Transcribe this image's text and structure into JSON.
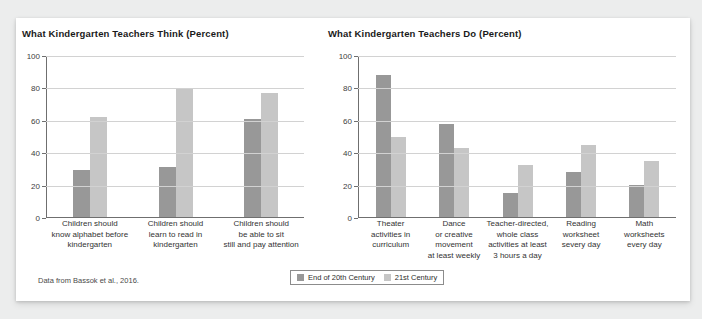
{
  "figure": {
    "source_note": "Data from Bassok et al., 2016.",
    "legend": {
      "items": [
        {
          "label": "End of 20th Century",
          "color": "#989898",
          "icon": "legend-swatch-icon"
        },
        {
          "label": "21st Century",
          "color": "#c6c6c6",
          "icon": "legend-swatch-icon"
        }
      ]
    },
    "colors": {
      "series_a": "#989898",
      "series_b": "#c6c6c6",
      "gridline": "#d2d2d2",
      "axis": "#6f6f6f",
      "card_background": "#ffffff",
      "page_background": "#eceded"
    }
  },
  "chart_data": [
    {
      "type": "bar",
      "title": "What Kindergarten Teachers Think (Percent)",
      "xlabel": "",
      "ylabel": "",
      "ylim": [
        0,
        100
      ],
      "yticks": [
        0,
        20,
        40,
        60,
        80,
        100
      ],
      "grid": true,
      "legend_position": "bottom",
      "categories": [
        "Children should know alphabet before kindergarten",
        "Children should learn to read in kindergarten",
        "Children should be able to sit still and pay attention"
      ],
      "category_lines": [
        [
          "Children should",
          "know alphabet before",
          "kindergarten"
        ],
        [
          "Children should",
          "learn to read in",
          "kindergarten"
        ],
        [
          "Children should",
          "be able to sit",
          "still and pay attention"
        ]
      ],
      "series": [
        {
          "name": "End of 20th Century",
          "values": [
            29,
            31,
            61
          ]
        },
        {
          "name": "21st Century",
          "values": [
            62,
            80,
            77
          ]
        }
      ]
    },
    {
      "type": "bar",
      "title": "What Kindergarten Teachers Do (Percent)",
      "xlabel": "",
      "ylabel": "",
      "ylim": [
        0,
        100
      ],
      "yticks": [
        0,
        20,
        40,
        60,
        80,
        100
      ],
      "grid": true,
      "legend_position": "bottom",
      "categories": [
        "Theater activities in curriculum",
        "Dance or creative movement at least weekly",
        "Teacher-directed, whole class activities at least 3 hours a day",
        "Reading worksheet severy day",
        "Math worksheets every day"
      ],
      "category_lines": [
        [
          "Theater",
          "activities in",
          "curriculum"
        ],
        [
          "Dance",
          "or creative",
          "movement",
          "at least weekly"
        ],
        [
          "Teacher-directed,",
          "whole class",
          "activities at least",
          "3 hours a day"
        ],
        [
          "Reading",
          "worksheet",
          "severy day"
        ],
        [
          "Math",
          "worksheets",
          "every day"
        ]
      ],
      "series": [
        {
          "name": "End of 20th Century",
          "values": [
            88,
            58,
            15,
            28,
            20
          ]
        },
        {
          "name": "21st Century",
          "values": [
            50,
            43,
            32,
            45,
            35
          ]
        }
      ]
    }
  ]
}
